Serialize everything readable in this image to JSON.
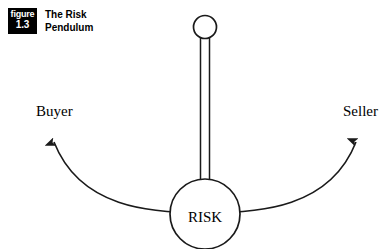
{
  "figure": {
    "badge_word": "figure",
    "badge_number": "1.3",
    "title": "The Risk\nPendulum"
  },
  "diagram": {
    "center_label": "RISK",
    "left_label": "Buyer",
    "right_label": "Seller",
    "stroke_color": "#1a1a1a",
    "fill_color": "#ffffff",
    "background_color": "#ffffff"
  }
}
